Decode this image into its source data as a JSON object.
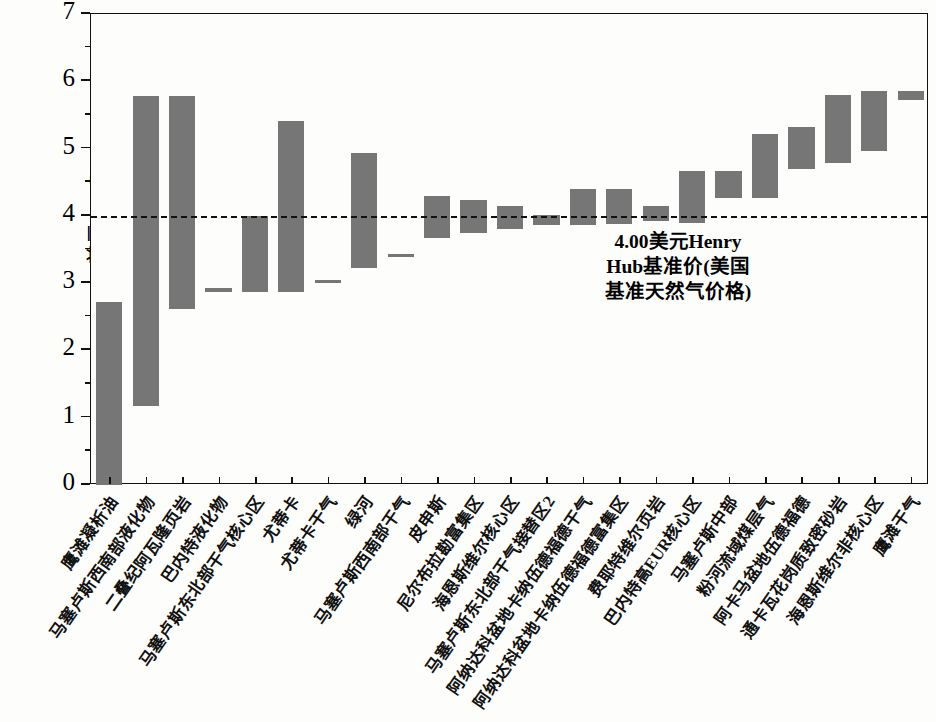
{
  "chart_data": {
    "type": "bar",
    "title": "",
    "subtitle": "",
    "xlabel": "",
    "ylabel": "美元/mmBtu",
    "ylim": [
      0,
      7
    ],
    "yticks": [
      0,
      1,
      2,
      3,
      4,
      5,
      6,
      7
    ],
    "ytick_labels": [
      "0",
      "1",
      "2",
      "3",
      "4",
      "5",
      "6",
      "7"
    ],
    "grid": false,
    "legend": null,
    "bar_color": "#767676",
    "frame_color": "#111111",
    "note": "Floating (range) bar chart: each bar spans from a low value to a high value.",
    "reference_line": {
      "value": 4.0,
      "style": "dashed",
      "color": "#111111",
      "label": "4.00美元Henry Hub基准价(美国基准天然气价格)",
      "label_lines": [
        "4.00美元Henry",
        "Hub基准价(美国",
        "基准天然气价格)"
      ]
    },
    "categories": [
      "鹰滩凝析油",
      "马塞卢斯西南部液化物",
      "二叠纪阿瓦隆页岩",
      "巴内特液化物",
      "马塞卢斯东北部干气核心区",
      "尤蒂卡",
      "尤蒂卡干气",
      "绿河",
      "马塞卢斯西南部干气",
      "皮申斯",
      "尼尔布拉勘富集区",
      "海恩斯维尔核心区",
      "马塞卢斯东北部干气接替区2",
      "阿纳达科盆地卡纳伍德福德干气",
      "阿纳达科盆地卡纳伍德福德富集区",
      "费耶特维尔页岩",
      "巴内特高EUR核心区",
      "马塞卢斯中部",
      "粉河流域煤层气",
      "阿卡马盆地伍德福德",
      "通卡瓦花岗质致密砂岩",
      "海恩斯维尔非核心区",
      "鹰滩干气"
    ],
    "low_values": [
      0.0,
      1.18,
      2.62,
      2.87,
      2.87,
      2.87,
      3.0,
      3.22,
      3.4,
      3.67,
      3.75,
      3.8,
      3.86,
      3.86,
      3.88,
      3.92,
      3.9,
      4.26,
      4.27,
      4.69,
      4.79,
      4.96,
      5.72
    ],
    "high_values": [
      2.72,
      5.78,
      5.78,
      2.93,
      4.0,
      5.41,
      3.05,
      4.93,
      3.43,
      4.3,
      4.24,
      4.14,
      4.02,
      4.4,
      4.4,
      4.15,
      4.67,
      4.67,
      5.22,
      5.32,
      5.8,
      5.85,
      5.85
    ],
    "values": [
      {
        "category": "鹰滩凝析油",
        "low": 0.0,
        "high": 2.72
      },
      {
        "category": "马塞卢斯西南部液化物",
        "low": 1.18,
        "high": 5.78
      },
      {
        "category": "二叠纪阿瓦隆页岩",
        "low": 2.62,
        "high": 5.78
      },
      {
        "category": "巴内特液化物",
        "low": 2.87,
        "high": 2.93
      },
      {
        "category": "马塞卢斯东北部干气核心区",
        "low": 2.87,
        "high": 4.0
      },
      {
        "category": "尤蒂卡",
        "low": 2.87,
        "high": 5.41
      },
      {
        "category": "尤蒂卡干气",
        "low": 3.0,
        "high": 3.05
      },
      {
        "category": "绿河",
        "low": 3.22,
        "high": 4.93
      },
      {
        "category": "马塞卢斯西南部干气",
        "low": 3.4,
        "high": 3.43
      },
      {
        "category": "皮申斯",
        "low": 3.67,
        "high": 4.3
      },
      {
        "category": "尼尔布拉勘富集区",
        "low": 3.75,
        "high": 4.24
      },
      {
        "category": "海恩斯维尔核心区",
        "low": 3.8,
        "high": 4.14
      },
      {
        "category": "马塞卢斯东北部干气接替区2",
        "low": 3.86,
        "high": 4.02
      },
      {
        "category": "阿纳达科盆地卡纳伍德福德干气",
        "low": 3.86,
        "high": 4.4
      },
      {
        "category": "阿纳达科盆地卡纳伍德福德富集区",
        "low": 3.88,
        "high": 4.4
      },
      {
        "category": "费耶特维尔页岩",
        "low": 3.92,
        "high": 4.15
      },
      {
        "category": "巴内特高EUR核心区",
        "low": 3.9,
        "high": 4.67
      },
      {
        "category": "马塞卢斯中部",
        "low": 4.26,
        "high": 4.67
      },
      {
        "category": "粉河流域煤层气",
        "low": 4.27,
        "high": 5.22
      },
      {
        "category": "阿卡马盆地伍德福德",
        "low": 4.69,
        "high": 5.32
      },
      {
        "category": "通卡瓦花岗质致密砂岩",
        "low": 4.79,
        "high": 5.8
      },
      {
        "category": "海恩斯维尔非核心区",
        "low": 4.96,
        "high": 5.85
      },
      {
        "category": "鹰滩干气",
        "low": 5.72,
        "high": 5.85
      }
    ]
  }
}
